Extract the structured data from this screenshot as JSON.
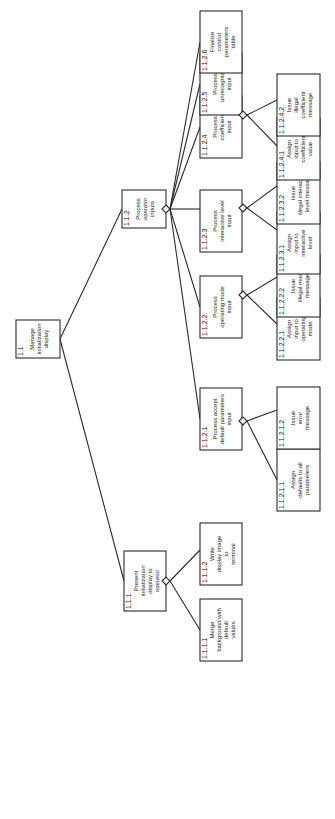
{
  "diagram": {
    "orientation": "rotated-90-ccw",
    "nodes": [
      {
        "id": "1.1",
        "lines": [
          "Manage",
          "initialization",
          "display"
        ],
        "x": 16,
        "y": 320,
        "w": 44,
        "h": 38
      },
      {
        "id": "1.1.1",
        "lines": [
          "Present",
          "initialization",
          "display to",
          "operator"
        ],
        "x": 124,
        "y": 551,
        "w": 42,
        "h": 60
      },
      {
        "id": "1.1.1.1",
        "lines": [
          "Merge",
          "background with",
          "default",
          "values"
        ],
        "x": 200,
        "y": 599,
        "w": 42,
        "h": 62
      },
      {
        "id": "1.1.1.2",
        "lines": [
          "Write",
          "display image",
          "to",
          "terminal"
        ],
        "x": 200,
        "y": 523,
        "w": 42,
        "h": 62
      },
      {
        "id": "1.1.2",
        "lines": [
          "Process",
          "operator",
          "inputs"
        ],
        "x": 122,
        "y": 190,
        "w": 44,
        "h": 38
      },
      {
        "id": "1.1.2.1",
        "lines": [
          "Process accept",
          "default parameters",
          "input"
        ],
        "x": 200,
        "y": 388,
        "w": 42,
        "h": 62
      },
      {
        "id": "1.1.2.1.1",
        "lines": [
          "Assign",
          "defaults to all",
          "parameters"
        ],
        "x": 277,
        "y": 449,
        "w": 43,
        "h": 62
      },
      {
        "id": "1.1.2.1.2",
        "lines": [
          "Issue",
          "error",
          "message"
        ],
        "x": 277,
        "y": 387,
        "w": 43,
        "h": 62
      },
      {
        "id": "1.1.2.2",
        "lines": [
          "Process",
          "operating mode",
          "input"
        ],
        "x": 200,
        "y": 276,
        "w": 42,
        "h": 62
      },
      {
        "id": "1.1.2.2.1",
        "lines": [
          "Assign",
          "input to",
          "operating",
          "mode"
        ],
        "x": 277,
        "y": 298,
        "w": 43,
        "h": 62
      },
      {
        "id": "1.1.2.2.2",
        "lines": [
          "Issue",
          "illegal mode",
          "message"
        ],
        "x": 277,
        "y": 255,
        "w": 43,
        "h": 62
      },
      {
        "id": "1.1.2.3",
        "lines": [
          "Process",
          "interactive level",
          "input"
        ],
        "x": 200,
        "y": 190,
        "w": 42,
        "h": 62
      },
      {
        "id": "1.1.2.3.1",
        "lines": [
          "Assign",
          "input to",
          "interactive",
          "level"
        ],
        "x": 277,
        "y": 212,
        "w": 43,
        "h": 62
      },
      {
        "id": "1.1.2.3.2",
        "lines": [
          "Issue",
          "illegal interactive",
          "level message"
        ],
        "x": 277,
        "y": 162,
        "w": 43,
        "h": 62
      },
      {
        "id": "1.1.2.4",
        "lines": [
          "Process",
          "coefficient",
          "input"
        ],
        "x": 200,
        "y": 96,
        "w": 42,
        "h": 62
      },
      {
        "id": "1.1.2.4.1",
        "lines": [
          "Assign",
          "input to",
          "coefficient",
          "value"
        ],
        "x": 277,
        "y": 118,
        "w": 43,
        "h": 62
      },
      {
        "id": "1.1.2.4.2",
        "lines": [
          "Issue",
          "illegal",
          "coefficient",
          "message"
        ],
        "x": 277,
        "y": 74,
        "w": 43,
        "h": 62
      },
      {
        "id": "1.1.2.5",
        "lines": [
          "Process",
          "unrecognized",
          "input"
        ],
        "x": 200,
        "y": 53,
        "w": 42,
        "h": 62
      },
      {
        "id": "1.1.2.6",
        "lines": [
          "Finalize",
          "control",
          "parameters",
          "table"
        ],
        "x": 200,
        "y": 11,
        "w": 42,
        "h": 62
      }
    ],
    "edges": [
      {
        "from": "1.1",
        "to": "1.1.1",
        "x1": 60,
        "y1": 339,
        "x2": 124,
        "y2": 581
      },
      {
        "from": "1.1",
        "to": "1.1.2",
        "x1": 60,
        "y1": 339,
        "x2": 122,
        "y2": 209
      },
      {
        "from": "1.1.1",
        "to": "1.1.1.1",
        "x1": 170,
        "y1": 581,
        "x2": 200,
        "y2": 630
      },
      {
        "from": "1.1.1",
        "to": "1.1.1.2",
        "x1": 170,
        "y1": 581,
        "x2": 200,
        "y2": 550
      },
      {
        "from": "1.1.2",
        "to": "1.1.2.1",
        "x1": 170,
        "y1": 209,
        "x2": 200,
        "y2": 419
      },
      {
        "from": "1.1.2",
        "to": "1.1.2.2",
        "x1": 170,
        "y1": 209,
        "x2": 200,
        "y2": 307
      },
      {
        "from": "1.1.2",
        "to": "1.1.2.3",
        "x1": 170,
        "y1": 209,
        "x2": 200,
        "y2": 209
      },
      {
        "from": "1.1.2",
        "to": "1.1.2.4",
        "x1": 170,
        "y1": 209,
        "x2": 200,
        "y2": 127
      },
      {
        "from": "1.1.2",
        "to": "1.1.2.5",
        "x1": 170,
        "y1": 209,
        "x2": 200,
        "y2": 84
      },
      {
        "from": "1.1.2",
        "to": "1.1.2.6",
        "x1": 170,
        "y1": 209,
        "x2": 200,
        "y2": 42
      },
      {
        "from": "1.1.2.1",
        "to": "1.1.2.1.1",
        "x1": 247,
        "y1": 421,
        "x2": 277,
        "y2": 480
      },
      {
        "from": "1.1.2.1",
        "to": "1.1.2.1.2",
        "x1": 247,
        "y1": 421,
        "x2": 277,
        "y2": 410
      },
      {
        "from": "1.1.2.2",
        "to": "1.1.2.2.1",
        "x1": 247,
        "y1": 295,
        "x2": 277,
        "y2": 324
      },
      {
        "from": "1.1.2.2",
        "to": "1.1.2.2.2",
        "x1": 247,
        "y1": 295,
        "x2": 277,
        "y2": 277
      },
      {
        "from": "1.1.2.3",
        "to": "1.1.2.3.1",
        "x1": 247,
        "y1": 208,
        "x2": 277,
        "y2": 230
      },
      {
        "from": "1.1.2.3",
        "to": "1.1.2.3.2",
        "x1": 247,
        "y1": 208,
        "x2": 277,
        "y2": 186
      },
      {
        "from": "1.1.2.4",
        "to": "1.1.2.4.1",
        "x1": 247,
        "y1": 115,
        "x2": 277,
        "y2": 146
      },
      {
        "from": "1.1.2.4",
        "to": "1.1.2.4.2",
        "x1": 247,
        "y1": 115,
        "x2": 277,
        "y2": 100
      }
    ],
    "diamonds": [
      {
        "node": "1.1.1",
        "cx": 166,
        "cy": 581
      },
      {
        "node": "1.1.2",
        "cx": 166,
        "cy": 209
      },
      {
        "node": "1.1.2.1",
        "cx": 243,
        "cy": 421
      },
      {
        "node": "1.1.2.2",
        "cx": 243,
        "cy": 295
      },
      {
        "node": "1.1.2.3",
        "cx": 243,
        "cy": 208
      },
      {
        "node": "1.1.2.4",
        "cx": 243,
        "cy": 115
      }
    ]
  }
}
